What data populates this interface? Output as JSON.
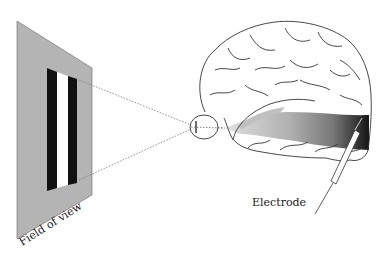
{
  "figure": {
    "labels": {
      "field_of_view": "Field of view",
      "electrode": "Electrode"
    },
    "colors": {
      "panel": "#b4b4b4",
      "bar_black": "#111111",
      "bar_white": "#ffffff",
      "pathway_light": "#c8c8c8",
      "pathway_dark": "#1a1a1a",
      "outline": "#333333"
    },
    "elements": [
      "field-of-view-panel",
      "stimulus-bars",
      "sight-lines",
      "eye",
      "brain",
      "visual-pathway",
      "electrode"
    ]
  }
}
